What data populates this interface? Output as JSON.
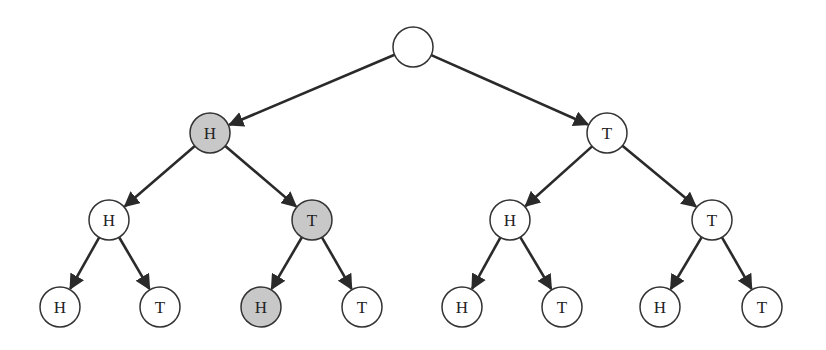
{
  "diagram": {
    "type": "binary-tree",
    "colors": {
      "highlight": "#c8c8c8",
      "normal": "#ffffff",
      "stroke": "#333333"
    },
    "node_radius": 20,
    "nodes": [
      {
        "id": "root",
        "label": "",
        "x": 413,
        "y": 47,
        "highlight": false
      },
      {
        "id": "H",
        "label": "H",
        "x": 210,
        "y": 133,
        "highlight": true
      },
      {
        "id": "T",
        "label": "T",
        "x": 607,
        "y": 133,
        "highlight": false
      },
      {
        "id": "HH",
        "label": "H",
        "x": 109,
        "y": 220,
        "highlight": false
      },
      {
        "id": "HT",
        "label": "T",
        "x": 312,
        "y": 220,
        "highlight": true
      },
      {
        "id": "TH",
        "label": "H",
        "x": 510,
        "y": 220,
        "highlight": false
      },
      {
        "id": "TT",
        "label": "T",
        "x": 712,
        "y": 220,
        "highlight": false
      },
      {
        "id": "HHH",
        "label": "H",
        "x": 60,
        "y": 307,
        "highlight": false
      },
      {
        "id": "HHT",
        "label": "T",
        "x": 160,
        "y": 307,
        "highlight": false
      },
      {
        "id": "HTH",
        "label": "H",
        "x": 261,
        "y": 307,
        "highlight": true
      },
      {
        "id": "HTT",
        "label": "T",
        "x": 362,
        "y": 307,
        "highlight": false
      },
      {
        "id": "THH",
        "label": "H",
        "x": 462,
        "y": 307,
        "highlight": false
      },
      {
        "id": "THT",
        "label": "T",
        "x": 562,
        "y": 307,
        "highlight": false
      },
      {
        "id": "TTH",
        "label": "H",
        "x": 660,
        "y": 307,
        "highlight": false
      },
      {
        "id": "TTT",
        "label": "T",
        "x": 762,
        "y": 307,
        "highlight": false
      }
    ],
    "edges": [
      [
        "root",
        "H"
      ],
      [
        "root",
        "T"
      ],
      [
        "H",
        "HH"
      ],
      [
        "H",
        "HT"
      ],
      [
        "T",
        "TH"
      ],
      [
        "T",
        "TT"
      ],
      [
        "HH",
        "HHH"
      ],
      [
        "HH",
        "HHT"
      ],
      [
        "HT",
        "HTH"
      ],
      [
        "HT",
        "HTT"
      ],
      [
        "TH",
        "THH"
      ],
      [
        "TH",
        "THT"
      ],
      [
        "TT",
        "TTH"
      ],
      [
        "TT",
        "TTT"
      ]
    ],
    "highlighted_path": [
      "root",
      "H",
      "HT",
      "HTH"
    ]
  }
}
